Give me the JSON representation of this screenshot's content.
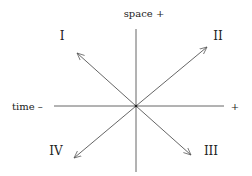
{
  "diagram": {
    "axes": {
      "vertical_label": "space +",
      "horizontal_left_label": "time –",
      "horizontal_right_label": "+"
    },
    "quadrants": [
      {
        "id": "I",
        "label": "I",
        "position": "upper-left"
      },
      {
        "id": "II",
        "label": "II",
        "position": "upper-right"
      },
      {
        "id": "III",
        "label": "III",
        "position": "lower-right"
      },
      {
        "id": "IV",
        "label": "IV",
        "position": "lower-left"
      }
    ],
    "line_color": "#555555",
    "text_color": "#222222"
  }
}
